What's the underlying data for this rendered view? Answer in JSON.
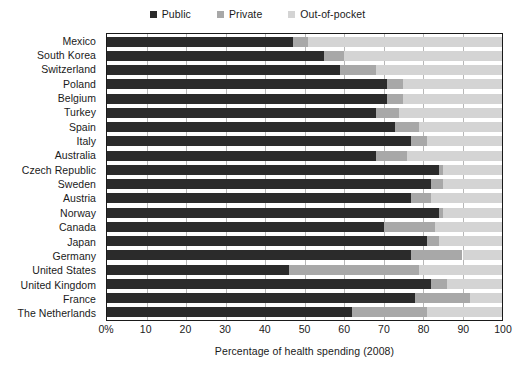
{
  "legend": {
    "items": [
      {
        "label": "Public",
        "color": "#2b2b2b",
        "icon": "square-swatch-icon"
      },
      {
        "label": "Private",
        "color": "#a8a8a8",
        "icon": "square-swatch-icon"
      },
      {
        "label": "Out-of-pocket",
        "color": "#d4d4d4",
        "icon": "square-swatch-icon"
      }
    ]
  },
  "axis": {
    "x_title": "Percentage of health spending (2008)",
    "ticks": [
      "0%",
      "10",
      "20",
      "30",
      "40",
      "50",
      "60",
      "70",
      "80",
      "90",
      "100"
    ],
    "tick_values": [
      0,
      10,
      20,
      30,
      40,
      50,
      60,
      70,
      80,
      90,
      100
    ]
  },
  "chart_data": {
    "type": "bar",
    "orientation": "horizontal",
    "stacked": true,
    "title": "",
    "subtitle": "",
    "xlabel": "Percentage of health spending (2008)",
    "ylabel": "",
    "xlim": [
      0,
      100
    ],
    "grid": true,
    "grid_axis": "x",
    "legend_position": "top-center",
    "categories": [
      "Mexico",
      "South Korea",
      "Switzerland",
      "Poland",
      "Belgium",
      "Turkey",
      "Spain",
      "Italy",
      "Australia",
      "Czech Republic",
      "Sweden",
      "Austria",
      "Norway",
      "Canada",
      "Japan",
      "Germany",
      "United States",
      "United Kingdom",
      "France",
      "The Netherlands"
    ],
    "series": [
      {
        "name": "Public",
        "color": "#2b2b2b",
        "values": [
          47,
          55,
          59,
          71,
          71,
          68,
          73,
          77,
          68,
          84,
          82,
          77,
          84,
          70,
          81,
          77,
          46,
          82,
          78,
          62
        ]
      },
      {
        "name": "Private",
        "color": "#a8a8a8",
        "values": [
          4,
          5,
          9,
          4,
          4,
          6,
          6,
          4,
          8,
          1,
          3,
          5,
          1,
          13,
          3,
          13,
          33,
          4,
          14,
          19
        ]
      },
      {
        "name": "Out-of-pocket",
        "color": "#d4d4d4",
        "values": [
          49,
          40,
          32,
          25,
          25,
          26,
          21,
          19,
          24,
          15,
          15,
          18,
          15,
          17,
          16,
          10,
          21,
          14,
          8,
          19
        ]
      }
    ]
  }
}
